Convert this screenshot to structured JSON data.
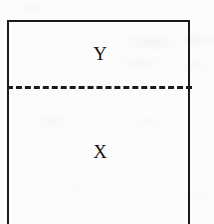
{
  "figure": {
    "type": "partitioned-rectangle-diagram",
    "background_color": "#fcfcfc",
    "stroke_color": "#1a1a1a",
    "box": {
      "border_style": "solid",
      "border_width_px": 2,
      "open_edge": "bottom"
    },
    "divider": {
      "style": "dashed",
      "orientation": "horizontal",
      "thickness_px": 3,
      "dash_length_px": 11,
      "gap_length_px": 5
    },
    "regions": [
      {
        "name": "upper-region",
        "label": "Y",
        "position": "above-divider"
      },
      {
        "name": "lower-region",
        "label": "X",
        "position": "below-divider"
      }
    ]
  }
}
